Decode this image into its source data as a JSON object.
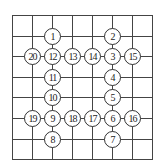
{
  "grid": {
    "x_lines": [
      12,
      32,
      52,
      72,
      92,
      112,
      132,
      152
    ],
    "y_lines": [
      15,
      35.6,
      56.2,
      76.8,
      97.4,
      118,
      138.6,
      159.2
    ],
    "line_color": "#444444"
  },
  "nodes": [
    {
      "label": "1",
      "x": 52,
      "y": 35.6
    },
    {
      "label": "2",
      "x": 112,
      "y": 35.6
    },
    {
      "label": "20",
      "x": 32,
      "y": 56.2
    },
    {
      "label": "12",
      "x": 52,
      "y": 56.2
    },
    {
      "label": "13",
      "x": 72,
      "y": 56.2
    },
    {
      "label": "14",
      "x": 92,
      "y": 56.2
    },
    {
      "label": "3",
      "x": 112,
      "y": 56.2
    },
    {
      "label": "15",
      "x": 132,
      "y": 56.2
    },
    {
      "label": "11",
      "x": 52,
      "y": 76.8
    },
    {
      "label": "4",
      "x": 112,
      "y": 76.8
    },
    {
      "label": "10",
      "x": 52,
      "y": 97.4
    },
    {
      "label": "5",
      "x": 112,
      "y": 97.4
    },
    {
      "label": "19",
      "x": 32,
      "y": 118
    },
    {
      "label": "9",
      "x": 52,
      "y": 118
    },
    {
      "label": "18",
      "x": 72,
      "y": 118
    },
    {
      "label": "17",
      "x": 92,
      "y": 118
    },
    {
      "label": "6",
      "x": 112,
      "y": 118
    },
    {
      "label": "16",
      "x": 132,
      "y": 118
    },
    {
      "label": "8",
      "x": 52,
      "y": 138.6
    },
    {
      "label": "7",
      "x": 112,
      "y": 138.6
    }
  ]
}
